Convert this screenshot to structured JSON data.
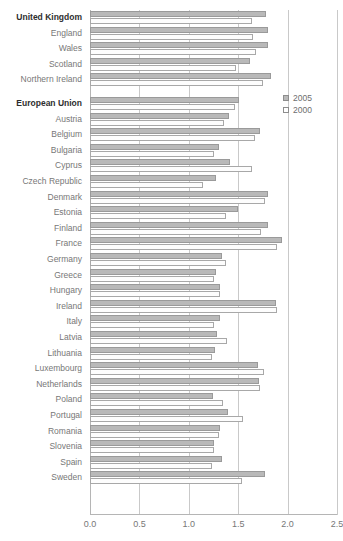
{
  "chart_data": {
    "type": "bar",
    "orientation": "horizontal",
    "title": "",
    "subtitle": "",
    "xlabel": "",
    "ylabel": "",
    "xlim": [
      0.0,
      2.5
    ],
    "xticks": [
      "0.0",
      "0.5",
      "1.0",
      "1.5",
      "2.0",
      "2.5"
    ],
    "xtick_values": [
      0.0,
      0.5,
      1.0,
      1.5,
      2.0,
      2.5
    ],
    "grid": true,
    "legend_position": "right",
    "bar_colors": {
      "2005": "#b9b9b9",
      "2000": "#ffffff"
    },
    "legend": [
      {
        "label": "2005",
        "style": "filled",
        "color": "#b9b9b9"
      },
      {
        "label": "2000",
        "style": "hollow",
        "color": "#ffffff"
      }
    ],
    "series": [
      {
        "name": "2005",
        "values": [
          1.78,
          1.8,
          1.8,
          1.62,
          1.83,
          1.51,
          1.41,
          1.72,
          1.31,
          1.42,
          1.28,
          1.8,
          1.5,
          1.8,
          1.94,
          1.34,
          1.28,
          1.32,
          1.88,
          1.32,
          1.29,
          1.27,
          1.7,
          1.71,
          1.24,
          1.4,
          1.32,
          1.26,
          1.34,
          1.77
        ]
      },
      {
        "name": "2000",
        "values": [
          1.64,
          1.65,
          1.68,
          1.48,
          1.75,
          1.47,
          1.36,
          1.67,
          1.26,
          1.64,
          1.14,
          1.77,
          1.38,
          1.73,
          1.89,
          1.38,
          1.26,
          1.32,
          1.89,
          1.26,
          1.39,
          1.23,
          1.76,
          1.72,
          1.35,
          1.55,
          1.31,
          1.26,
          1.23,
          1.54
        ]
      }
    ],
    "categories": [
      {
        "label": "United Kingdom",
        "bold": true,
        "gap_after": false
      },
      {
        "label": "England",
        "bold": false,
        "gap_after": false
      },
      {
        "label": "Wales",
        "bold": false,
        "gap_after": false
      },
      {
        "label": "Scotland",
        "bold": false,
        "gap_after": false
      },
      {
        "label": "Northern Ireland",
        "bold": false,
        "gap_after": true
      },
      {
        "label": "European Union",
        "bold": true,
        "gap_after": false
      },
      {
        "label": "Austria",
        "bold": false,
        "gap_after": false
      },
      {
        "label": "Belgium",
        "bold": false,
        "gap_after": false
      },
      {
        "label": "Bulgaria",
        "bold": false,
        "gap_after": false
      },
      {
        "label": "Cyprus",
        "bold": false,
        "gap_after": false
      },
      {
        "label": "Czech Republic",
        "bold": false,
        "gap_after": false
      },
      {
        "label": "Denmark",
        "bold": false,
        "gap_after": false
      },
      {
        "label": "Estonia",
        "bold": false,
        "gap_after": false
      },
      {
        "label": "Finland",
        "bold": false,
        "gap_after": false
      },
      {
        "label": "France",
        "bold": false,
        "gap_after": false
      },
      {
        "label": "Germany",
        "bold": false,
        "gap_after": false
      },
      {
        "label": "Greece",
        "bold": false,
        "gap_after": false
      },
      {
        "label": "Hungary",
        "bold": false,
        "gap_after": false
      },
      {
        "label": "Ireland",
        "bold": false,
        "gap_after": false
      },
      {
        "label": "Italy",
        "bold": false,
        "gap_after": false
      },
      {
        "label": "Latvia",
        "bold": false,
        "gap_after": false
      },
      {
        "label": "Lithuania",
        "bold": false,
        "gap_after": false
      },
      {
        "label": "Luxembourg",
        "bold": false,
        "gap_after": false
      },
      {
        "label": "Netherlands",
        "bold": false,
        "gap_after": false
      },
      {
        "label": "Poland",
        "bold": false,
        "gap_after": false
      },
      {
        "label": "Portugal",
        "bold": false,
        "gap_after": false
      },
      {
        "label": "Romania",
        "bold": false,
        "gap_after": false
      },
      {
        "label": "Slovenia",
        "bold": false,
        "gap_after": false
      },
      {
        "label": "Spain",
        "bold": false,
        "gap_after": false
      },
      {
        "label": "Sweden",
        "bold": false,
        "gap_after": false
      }
    ]
  }
}
